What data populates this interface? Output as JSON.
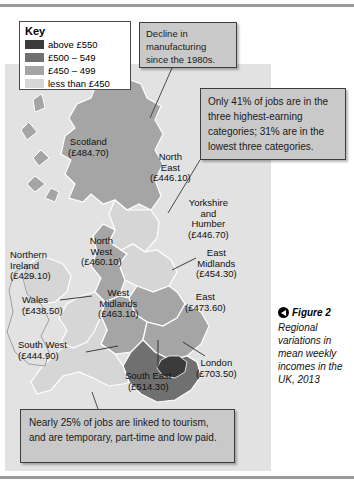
{
  "key": {
    "title": "Key",
    "items": [
      {
        "label": "above £550",
        "color": "#3b3b3b"
      },
      {
        "label": "£500 – 549",
        "color": "#707070"
      },
      {
        "label": "£450 – 499",
        "color": "#a5a5a5"
      },
      {
        "label": "less than £450",
        "color": "#d6d6d6"
      }
    ]
  },
  "callouts": {
    "manufacturing": "Decline in manufacturing since the 1980s.",
    "jobs": "Only 41% of jobs are in the three highest-earning categories; 31% are in the lowest three categories.",
    "tourism": "Nearly 25% of jobs are linked to tourism, and are temporary, part-time and low paid."
  },
  "caption": {
    "figure_label": "Figure 2",
    "text": "Regional variations in mean weekly incomes in the UK, 2013"
  },
  "chart_data": {
    "type": "map",
    "title": "Regional variations in mean weekly incomes in the UK, 2013",
    "unit": "£ per week",
    "year": 2013,
    "legend_position": "top-left",
    "bins": [
      {
        "label": "above £550",
        "min": 550,
        "max": null,
        "color": "#3b3b3b"
      },
      {
        "label": "£500 – 549",
        "min": 500,
        "max": 549,
        "color": "#707070"
      },
      {
        "label": "£450 – 499",
        "min": 450,
        "max": 499,
        "color": "#a5a5a5"
      },
      {
        "label": "less than £450",
        "min": null,
        "max": 450,
        "color": "#d6d6d6"
      }
    ],
    "regions": [
      {
        "name": "Scotland",
        "value": 484.7,
        "label": "Scotland (£484.70)",
        "bin": "£450 – 499"
      },
      {
        "name": "North East",
        "value": 446.1,
        "label": "North East (£446.10)",
        "bin": "less than £450"
      },
      {
        "name": "Yorkshire and Humber",
        "value": 446.7,
        "label": "Yorkshire and Humber (£446.70)",
        "bin": "less than £450"
      },
      {
        "name": "North West",
        "value": 460.1,
        "label": "North West (£460.10)",
        "bin": "£450 – 499"
      },
      {
        "name": "Northern Ireland",
        "value": 429.1,
        "label": "Northern Ireland (£429.10)",
        "bin": "less than £450"
      },
      {
        "name": "East Midlands",
        "value": 454.3,
        "label": "East Midlands (£454.30)",
        "bin": "£450 – 499"
      },
      {
        "name": "Wales",
        "value": 438.5,
        "label": "Wales (£438.50)",
        "bin": "less than £450"
      },
      {
        "name": "West Midlands",
        "value": 463.1,
        "label": "West Midlands (£463.10)",
        "bin": "£450 – 499"
      },
      {
        "name": "East",
        "value": 473.6,
        "label": "East (£473.60)",
        "bin": "£450 – 499"
      },
      {
        "name": "South West",
        "value": 444.9,
        "label": "South West (£444.90)",
        "bin": "less than £450"
      },
      {
        "name": "South East",
        "value": 514.3,
        "label": "South East (£514.30)",
        "bin": "£500 – 549"
      },
      {
        "name": "London",
        "value": 703.5,
        "label": "London (£703.50)",
        "bin": "above £550"
      }
    ],
    "annotations": [
      "Decline in manufacturing since the 1980s.",
      "Only 41% of jobs are in the three highest-earning categories; 31% are in the lowest three categories.",
      "Nearly 25% of jobs are linked to tourism, and are temporary, part-time and low paid."
    ]
  },
  "labels": {
    "scotland": "Scotland\n(£484.70)",
    "north_east": "North\nEast\n(£446.10)",
    "yorkshire": "Yorkshire\nand\nHumber\n(£446.70)",
    "north_west": "North\nWest\n(£460.10)",
    "n_ireland": "Northern\nIreland\n(£429.10)",
    "east_midlands": "East\nMidlands\n(£454.30)",
    "wales": "Wales\n(£438.50)",
    "west_midlands": "West\nMidlands\n(£463.10)",
    "east": "East\n(£473.60)",
    "south_west": "South West\n(£444.90)",
    "south_east": "South East\n(£514.30)",
    "london": "London\n(£703.50)"
  }
}
